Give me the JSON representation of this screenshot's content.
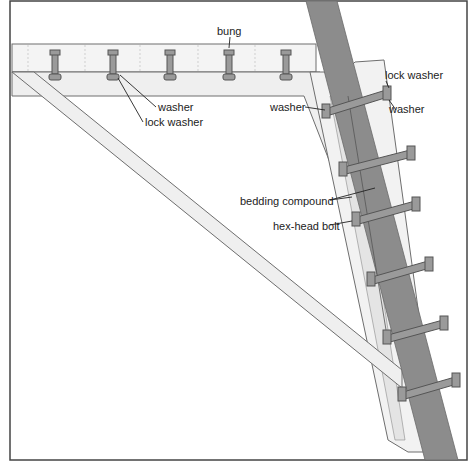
{
  "diagram": {
    "type": "technical-illustration",
    "colors": {
      "background": "#ffffff",
      "border": "#444444",
      "post_fill": "#8c8c8c",
      "wood_fill": "#efefef",
      "wood_stroke": "#6e6e6e",
      "bolt_fill": "#9a9a9a",
      "bolt_stroke": "#555555",
      "leader": "#222222"
    },
    "labels": {
      "bung": "bung",
      "washer_top": "washer",
      "lock_washer_top": "lock washer",
      "lock_washer_right": "lock washer",
      "washer_right": "washer",
      "washer_left": "washer",
      "bedding_compound": "bedding compound",
      "hex_head_bolt": "hex-head bolt"
    }
  }
}
